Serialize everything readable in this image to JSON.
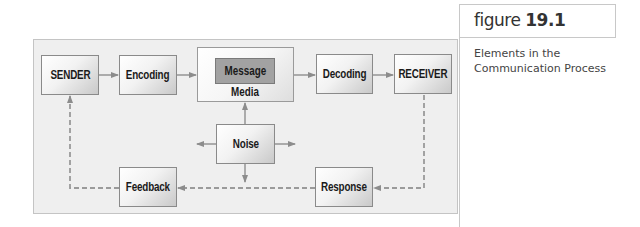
{
  "figure": {
    "label": "figure",
    "number": "19.1",
    "caption_line1": "Elements in the",
    "caption_line2": "Communication Process"
  },
  "diagram": {
    "nodes": {
      "sender": "SENDER",
      "encoding": "Encoding",
      "message": "Message",
      "media": "Media",
      "decoding": "Decoding",
      "receiver": "RECEIVER",
      "noise": "Noise",
      "response": "Response",
      "feedback": "Feedback"
    },
    "edges": [
      {
        "from": "SENDER",
        "to": "Encoding",
        "style": "solid"
      },
      {
        "from": "Encoding",
        "to": "Media",
        "style": "solid"
      },
      {
        "from": "Media",
        "to": "Decoding",
        "style": "solid"
      },
      {
        "from": "Decoding",
        "to": "RECEIVER",
        "style": "solid"
      },
      {
        "from": "Noise",
        "to": "Media",
        "style": "solid"
      },
      {
        "from": "RECEIVER",
        "to": "Response",
        "style": "dashed"
      },
      {
        "from": "Response",
        "to": "Feedback",
        "style": "dashed"
      },
      {
        "from": "Feedback",
        "to": "SENDER",
        "style": "dashed"
      }
    ],
    "colors": {
      "panel_bg": "#efefef",
      "message_bg": "#a2a2a2",
      "arrow": "#8c8c8c"
    }
  }
}
